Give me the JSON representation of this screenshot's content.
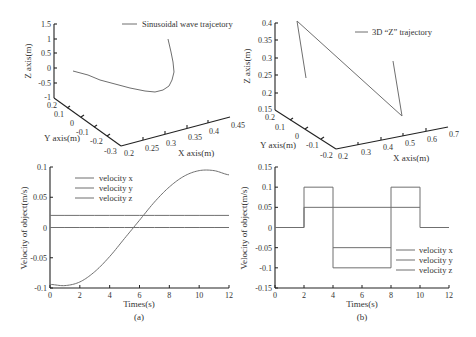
{
  "figure": {
    "panel_a_caption": "(a)",
    "panel_b_caption": "(b)"
  },
  "colors": {
    "axis": "#222222",
    "line": "#6f6f6f",
    "text": "#333333"
  },
  "chart_data": [
    {
      "id": "top-left-3d",
      "type": "line",
      "projection": "3d",
      "title": "",
      "legend": [
        "Sinusoidal wave trajcetory"
      ],
      "legend_position": "top-right",
      "xlabel": "X axis(m)",
      "ylabel": "Y axis(m)",
      "zlabel": "Z axis(m)",
      "xticks": [
        "0.2",
        "0.25",
        "0.3",
        "0.35",
        "0.4",
        "0.45"
      ],
      "yticks": [
        "0.2",
        "0.1",
        "0",
        "-0.1",
        "-0.2",
        "-0.3"
      ],
      "zticks": [
        "1.5",
        "1",
        "0.5",
        "0",
        "-0.5",
        "-1"
      ],
      "xlim": [
        0.2,
        0.45
      ],
      "ylim": [
        -0.3,
        0.2
      ],
      "zlim": [
        -1,
        1.5
      ],
      "grid": false,
      "series": [
        {
          "name": "Sinusoidal wave trajcetory",
          "screen_points": [
            [
              73,
              71
            ],
            [
              88,
              75
            ],
            [
              100,
              80
            ],
            [
              115,
              84
            ],
            [
              130,
              88
            ],
            [
              145,
              91
            ],
            [
              155,
              92
            ],
            [
              163,
              90
            ],
            [
              169,
              86
            ],
            [
              172,
              80
            ],
            [
              174,
              72
            ],
            [
              173,
              62
            ],
            [
              171,
              52
            ],
            [
              168,
              39
            ]
          ]
        }
      ]
    },
    {
      "id": "top-right-3d",
      "type": "line",
      "projection": "3d",
      "title": "",
      "legend": [
        "3D “Z” trajectory"
      ],
      "legend_position": "top-right",
      "xlabel": "X axis(m)",
      "ylabel": "Y axis(m)",
      "zlabel": "Z axis(m)",
      "xticks": [
        "0.2",
        "0.3",
        "0.4",
        "0.5",
        "0.6",
        "0.7"
      ],
      "yticks": [
        "0.2",
        "0.1",
        "0",
        "-0.1",
        "-0.2"
      ],
      "zticks": [
        "0.4",
        "0.35",
        "0.3",
        "0.25",
        "0.2",
        "0.15"
      ],
      "xlim": [
        0.2,
        0.7
      ],
      "ylim": [
        -0.2,
        0.2
      ],
      "zlim": [
        0.15,
        0.4
      ],
      "grid": false,
      "series": [
        {
          "name": "3D “Z” trajectory",
          "screen_points": [
            [
              306,
              78
            ],
            [
              297,
              21
            ],
            [
              402,
              116
            ],
            [
              393,
              61
            ]
          ]
        }
      ]
    },
    {
      "id": "bottom-left-velocity",
      "type": "line",
      "title": "",
      "caption": "(a)",
      "xlabel": "Times(s)",
      "ylabel": "Velocity of object(m/s)",
      "x_ticks": [
        "0",
        "2",
        "4",
        "6",
        "8",
        "10",
        "12"
      ],
      "y_ticks": [
        "0.1",
        "0.05",
        "0",
        "-0.05",
        "-0.1"
      ],
      "xlim": [
        0,
        12
      ],
      "ylim": [
        -0.1,
        0.1
      ],
      "grid": false,
      "legend_position": "upper-left",
      "x": [
        0,
        1,
        2,
        3,
        4,
        5,
        6,
        7,
        8,
        9,
        10,
        11,
        12
      ],
      "series": [
        {
          "name": "velocity x",
          "values": [
            -0.094,
            -0.096,
            -0.09,
            -0.073,
            -0.048,
            -0.018,
            0.012,
            0.042,
            0.067,
            0.085,
            0.094,
            0.094,
            0.087
          ]
        },
        {
          "name": "velocity y",
          "values": [
            0.02,
            0.02,
            0.02,
            0.02,
            0.02,
            0.02,
            0.02,
            0.02,
            0.02,
            0.02,
            0.02,
            0.02,
            0.02
          ]
        },
        {
          "name": "velocity z",
          "values": [
            0,
            0,
            0,
            0,
            0,
            0,
            0,
            0,
            0,
            0,
            0,
            0,
            0
          ]
        }
      ]
    },
    {
      "id": "bottom-right-velocity",
      "type": "line",
      "title": "",
      "caption": "(b)",
      "xlabel": "Times(s)",
      "ylabel": "Velocity of object(m/s)",
      "x_ticks": [
        "0",
        "2",
        "4",
        "6",
        "8",
        "10",
        "12"
      ],
      "y_ticks": [
        "0.15",
        "0.1",
        "0.05",
        "0",
        "-0.05",
        "-0.1",
        "-0.15"
      ],
      "xlim": [
        0,
        12
      ],
      "ylim": [
        -0.15,
        0.15
      ],
      "grid": false,
      "legend_position": "lower-right",
      "series": [
        {
          "name": "velocity x",
          "steps": [
            [
              0,
              2,
              0
            ],
            [
              2,
              4,
              0.1
            ],
            [
              4,
              8,
              -0.1
            ],
            [
              8,
              10,
              0.1
            ],
            [
              10,
              12,
              0
            ]
          ]
        },
        {
          "name": "velocity y",
          "steps": [
            [
              4,
              8,
              -0.05
            ]
          ]
        },
        {
          "name": "velocity z",
          "steps": [
            [
              2,
              10,
              0.05
            ]
          ]
        }
      ]
    }
  ]
}
